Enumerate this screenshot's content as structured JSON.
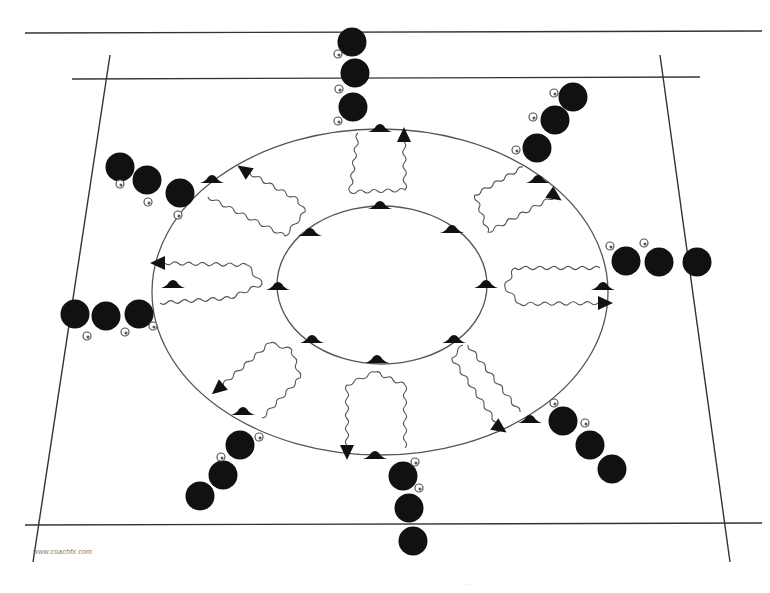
{
  "diagram": {
    "watermark": "www.coachfx.com",
    "footer_mark": "...",
    "colors": {
      "background": "#ffffff",
      "line": "#555555",
      "pitch_line": "#333333",
      "player": "#111111",
      "cone": "#111111",
      "ball_fill": "#ffffff",
      "ball_stroke": "#555555"
    },
    "pitch": {
      "lines": [
        {
          "name": "top-outer-line",
          "x1": 25,
          "y1": 33,
          "x2": 762,
          "y2": 31
        },
        {
          "name": "top-inner-line",
          "x1": 72,
          "y1": 79,
          "x2": 700,
          "y2": 77
        },
        {
          "name": "bottom-line",
          "x1": 25,
          "y1": 525,
          "x2": 762,
          "y2": 523
        },
        {
          "name": "left-sideline",
          "x1": 110,
          "y1": 55,
          "x2": 33,
          "y2": 562
        },
        {
          "name": "right-sideline",
          "x1": 660,
          "y1": 55,
          "x2": 730,
          "y2": 562
        }
      ]
    },
    "outer_ring": {
      "cx": 380,
      "cy": 292,
      "rx": 228,
      "ry": 163
    },
    "inner_ring": {
      "cx": 382,
      "cy": 285,
      "rx": 105,
      "ry": 79
    },
    "outer_cones": [
      {
        "x": 380,
        "y": 129
      },
      {
        "x": 212,
        "y": 180
      },
      {
        "x": 538,
        "y": 180
      },
      {
        "x": 173,
        "y": 285
      },
      {
        "x": 603,
        "y": 287
      },
      {
        "x": 243,
        "y": 412
      },
      {
        "x": 530,
        "y": 420
      },
      {
        "x": 375,
        "y": 456
      }
    ],
    "inner_cones": [
      {
        "x": 380,
        "y": 206
      },
      {
        "x": 310,
        "y": 233
      },
      {
        "x": 452,
        "y": 230
      },
      {
        "x": 278,
        "y": 287
      },
      {
        "x": 486,
        "y": 285
      },
      {
        "x": 312,
        "y": 340
      },
      {
        "x": 454,
        "y": 340
      },
      {
        "x": 377,
        "y": 360
      }
    ],
    "player_groups": [
      {
        "name": "north",
        "players": [
          {
            "x": 352,
            "y": 42
          },
          {
            "x": 355,
            "y": 73
          },
          {
            "x": 353,
            "y": 107
          }
        ],
        "balls": [
          {
            "x": 338,
            "y": 54
          },
          {
            "x": 339,
            "y": 89
          },
          {
            "x": 338,
            "y": 121
          }
        ]
      },
      {
        "name": "north-east",
        "players": [
          {
            "x": 573,
            "y": 97
          },
          {
            "x": 555,
            "y": 120
          },
          {
            "x": 537,
            "y": 148
          }
        ],
        "balls": [
          {
            "x": 554,
            "y": 93
          },
          {
            "x": 533,
            "y": 117
          },
          {
            "x": 516,
            "y": 150
          }
        ]
      },
      {
        "name": "east",
        "players": [
          {
            "x": 626,
            "y": 261
          },
          {
            "x": 659,
            "y": 262
          },
          {
            "x": 697,
            "y": 262
          }
        ],
        "balls": [
          {
            "x": 610,
            "y": 246
          },
          {
            "x": 644,
            "y": 243
          }
        ]
      },
      {
        "name": "south-east",
        "players": [
          {
            "x": 563,
            "y": 421
          },
          {
            "x": 590,
            "y": 445
          },
          {
            "x": 612,
            "y": 469
          }
        ],
        "balls": [
          {
            "x": 554,
            "y": 403
          },
          {
            "x": 585,
            "y": 423
          }
        ]
      },
      {
        "name": "south",
        "players": [
          {
            "x": 403,
            "y": 476
          },
          {
            "x": 409,
            "y": 508
          },
          {
            "x": 413,
            "y": 541
          }
        ],
        "balls": [
          {
            "x": 415,
            "y": 462
          },
          {
            "x": 419,
            "y": 488
          }
        ]
      },
      {
        "name": "south-west",
        "players": [
          {
            "x": 240,
            "y": 445
          },
          {
            "x": 223,
            "y": 475
          },
          {
            "x": 200,
            "y": 496
          }
        ],
        "balls": [
          {
            "x": 259,
            "y": 437
          },
          {
            "x": 221,
            "y": 457
          }
        ]
      },
      {
        "name": "west",
        "players": [
          {
            "x": 75,
            "y": 314
          },
          {
            "x": 106,
            "y": 316
          },
          {
            "x": 139,
            "y": 314
          }
        ],
        "balls": [
          {
            "x": 87,
            "y": 336
          },
          {
            "x": 125,
            "y": 332
          },
          {
            "x": 153,
            "y": 326
          }
        ]
      },
      {
        "name": "north-west",
        "players": [
          {
            "x": 120,
            "y": 167
          },
          {
            "x": 147,
            "y": 180
          },
          {
            "x": 180,
            "y": 193
          }
        ],
        "balls": [
          {
            "x": 120,
            "y": 184
          },
          {
            "x": 148,
            "y": 202
          },
          {
            "x": 178,
            "y": 215
          }
        ]
      }
    ],
    "dribble_paths": [
      {
        "name": "north-path",
        "points": [
          [
            358,
            133
          ],
          [
            350,
            192
          ],
          [
            405,
            190
          ],
          [
            404,
            135
          ]
        ],
        "arrow_at": [
          404,
          135
        ],
        "arrow_dir": "up"
      },
      {
        "name": "north-east-path",
        "points": [
          [
            523,
            167
          ],
          [
            475,
            195
          ],
          [
            488,
            232
          ],
          [
            555,
            196
          ]
        ],
        "arrow_at": [
          555,
          196
        ],
        "arrow_dir": "down-right"
      },
      {
        "name": "east-path",
        "points": [
          [
            600,
            268
          ],
          [
            515,
            268
          ],
          [
            505,
            287
          ],
          [
            520,
            304
          ],
          [
            605,
            303
          ]
        ],
        "arrow_at": [
          605,
          303
        ],
        "arrow_dir": "right"
      },
      {
        "name": "south-east-path",
        "points": [
          [
            463,
            345
          ],
          [
            452,
            358
          ],
          [
            500,
            428
          ]
        ],
        "arrow_at": [
          500,
          428
        ],
        "arrow_dir": "down-right",
        "return_points": [
          [
            468,
            345
          ],
          [
            520,
            412
          ]
        ]
      },
      {
        "name": "south-path",
        "points": [
          [
            405,
            448
          ],
          [
            405,
            385
          ],
          [
            375,
            372
          ],
          [
            347,
            385
          ],
          [
            347,
            452
          ]
        ],
        "arrow_at": [
          347,
          452
        ],
        "arrow_dir": "down"
      },
      {
        "name": "south-west-path",
        "points": [
          [
            262,
            418
          ],
          [
            300,
            378
          ],
          [
            292,
            350
          ],
          [
            270,
            343
          ],
          [
            218,
            389
          ]
        ],
        "arrow_at": [
          218,
          389
        ],
        "arrow_dir": "down-left"
      },
      {
        "name": "west-path",
        "points": [
          [
            160,
            303
          ],
          [
            230,
            298
          ],
          [
            262,
            284
          ],
          [
            247,
            265
          ],
          [
            158,
            263
          ]
        ],
        "arrow_at": [
          158,
          263
        ],
        "arrow_dir": "left"
      },
      {
        "name": "north-west-path",
        "points": [
          [
            208,
            197
          ],
          [
            285,
            236
          ],
          [
            305,
            212
          ],
          [
            298,
            200
          ],
          [
            244,
            170
          ]
        ],
        "arrow_at": [
          244,
          170
        ],
        "arrow_dir": "up-left"
      }
    ]
  }
}
